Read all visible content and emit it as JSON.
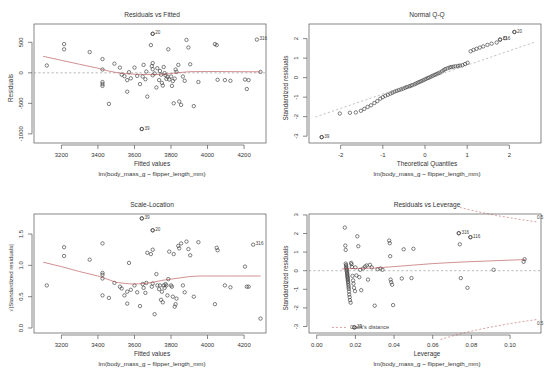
{
  "figure": {
    "kind": "r-lm-diagnostic-panel",
    "layout": "2x2",
    "width": 550,
    "height": 379,
    "model_caption": "lm(body_mass_g ~ flipper_length_mm)",
    "point_color": "#3c3c3c",
    "loess_color": "#b4474c",
    "reference_color": "#9a9a9a"
  },
  "chart_data": [
    {
      "type": "scatter",
      "id": "residuals-vs-fitted",
      "title": "Residuals vs Fitted",
      "xlabel": "Fitted values",
      "ylabel": "Residuals",
      "caption": "lm(body_mass_g ~ flipper_length_mm)",
      "xlim": [
        3050,
        4320
      ],
      "ylim": [
        -1150,
        800
      ],
      "xticks": [
        3200,
        3400,
        3600,
        3800,
        4000,
        4200
      ],
      "yticks": [
        -1000,
        -500,
        0,
        500
      ],
      "grid": false,
      "reference_line": {
        "type": "horizontal",
        "y": 0,
        "style": "dotted"
      },
      "smoother": "loess",
      "smoother_points": [
        [
          3100,
          270
        ],
        [
          3200,
          205
        ],
        [
          3300,
          140
        ],
        [
          3400,
          75
        ],
        [
          3450,
          35
        ],
        [
          3500,
          5
        ],
        [
          3550,
          -12
        ],
        [
          3600,
          -22
        ],
        [
          3650,
          -28
        ],
        [
          3700,
          -30
        ],
        [
          3750,
          -25
        ],
        [
          3800,
          -12
        ],
        [
          3850,
          5
        ],
        [
          3900,
          18
        ],
        [
          4000,
          22
        ],
        [
          4100,
          20
        ],
        [
          4200,
          18
        ],
        [
          4290,
          16
        ]
      ],
      "labeled_points": [
        {
          "label": "20",
          "x": 3700,
          "y": 640
        },
        {
          "label": "316",
          "x": 4270,
          "y": 545
        },
        {
          "label": "39",
          "x": 3640,
          "y": -920
        }
      ],
      "x": [
        3120,
        3215,
        3215,
        3355,
        3425,
        3425,
        3425,
        3425,
        3425,
        3460,
        3490,
        3520,
        3530,
        3545,
        3560,
        3560,
        3570,
        3580,
        3600,
        3615,
        3630,
        3640,
        3645,
        3650,
        3660,
        3665,
        3670,
        3690,
        3695,
        3700,
        3700,
        3700,
        3700,
        3710,
        3720,
        3725,
        3735,
        3740,
        3745,
        3750,
        3755,
        3760,
        3765,
        3770,
        3775,
        3780,
        3785,
        3790,
        3800,
        3805,
        3810,
        3815,
        3820,
        3825,
        3830,
        3840,
        3845,
        3855,
        3865,
        3875,
        3885,
        3895,
        3905,
        3925,
        3950,
        4040,
        4050,
        4055,
        4095,
        4125,
        4205,
        4215,
        4225,
        4290
      ],
      "y": [
        120,
        470,
        385,
        340,
        225,
        55,
        -150,
        -185,
        -215,
        -510,
        150,
        85,
        -30,
        -55,
        -120,
        -310,
        10,
        -90,
        85,
        -50,
        -185,
        -920,
        -60,
        130,
        -105,
        20,
        -390,
        455,
        110,
        640,
        160,
        60,
        -40,
        -10,
        -240,
        75,
        -120,
        30,
        -30,
        -165,
        -210,
        95,
        -5,
        -40,
        -100,
        -65,
        385,
        -110,
        -60,
        -215,
        -135,
        -500,
        -95,
        55,
        15,
        130,
        -470,
        -525,
        -60,
        -130,
        540,
        415,
        140,
        -545,
        -150,
        470,
        455,
        -115,
        -120,
        -130,
        -110,
        -265,
        -120,
        15
      ]
    },
    {
      "type": "scatter",
      "id": "normal-qq",
      "title": "Normal Q-Q",
      "xlabel": "Theoretical Quantiles",
      "ylabel": "Standardized residuals",
      "caption": "lm(body_mass_g ~ flipper_length_mm)",
      "xlim": [
        -2.75,
        2.75
      ],
      "ylim": [
        -3.35,
        2.75
      ],
      "xticks": [
        -2,
        -1,
        0,
        1,
        2
      ],
      "yticks": [
        -3,
        -2,
        -1,
        0,
        1,
        2
      ],
      "grid": false,
      "reference_line": {
        "type": "qq-line",
        "style": "dotted",
        "p1": [
          -2.6,
          -2.02
        ],
        "p2": [
          2.6,
          1.82
        ]
      },
      "labeled_points": [
        {
          "label": "39",
          "x": -2.45,
          "y": -3.05
        },
        {
          "label": "20",
          "x": 2.12,
          "y": 2.34
        },
        {
          "label": "316",
          "x": 1.78,
          "y": 1.95
        }
      ],
      "x": [
        -2.45,
        -2.02,
        -1.78,
        -1.64,
        -1.52,
        -1.44,
        -1.36,
        -1.28,
        -1.2,
        -1.13,
        -1.06,
        -1.0,
        -0.94,
        -0.88,
        -0.82,
        -0.77,
        -0.72,
        -0.67,
        -0.62,
        -0.57,
        -0.52,
        -0.47,
        -0.43,
        -0.38,
        -0.34,
        -0.3,
        -0.25,
        -0.21,
        -0.17,
        -0.13,
        -0.09,
        -0.05,
        -0.01,
        0.03,
        0.07,
        0.11,
        0.15,
        0.19,
        0.23,
        0.27,
        0.31,
        0.35,
        0.4,
        0.44,
        0.48,
        0.53,
        0.58,
        0.62,
        0.67,
        0.72,
        0.78,
        0.83,
        0.89,
        0.95,
        1.01,
        1.08,
        1.15,
        1.22,
        1.3,
        1.38,
        1.48,
        1.58,
        1.7,
        1.78,
        1.9,
        2.12
      ],
      "y": [
        -3.05,
        -1.84,
        -1.8,
        -1.78,
        -1.7,
        -1.6,
        -1.5,
        -1.42,
        -1.3,
        -1.2,
        -1.08,
        -1.0,
        -0.93,
        -0.88,
        -0.82,
        -0.77,
        -0.72,
        -0.68,
        -0.64,
        -0.6,
        -0.56,
        -0.52,
        -0.48,
        -0.45,
        -0.42,
        -0.38,
        -0.34,
        -0.3,
        -0.26,
        -0.22,
        -0.18,
        -0.14,
        -0.1,
        -0.06,
        -0.02,
        0.02,
        0.06,
        0.1,
        0.14,
        0.18,
        0.22,
        0.26,
        0.32,
        0.38,
        0.44,
        0.48,
        0.52,
        0.54,
        0.56,
        0.58,
        0.6,
        0.62,
        0.64,
        0.7,
        0.76,
        1.35,
        1.42,
        1.48,
        1.54,
        1.6,
        1.68,
        1.74,
        1.8,
        1.95,
        2.02,
        2.34
      ]
    },
    {
      "type": "scatter",
      "id": "scale-location",
      "title": "Scale-Location",
      "xlabel": "Fitted values",
      "ylabel": "√|Standardized residuals|",
      "caption": "lm(body_mass_g ~ flipper_length_mm)",
      "xlim": [
        3050,
        4320
      ],
      "ylim": [
        -0.08,
        1.82
      ],
      "xticks": [
        3200,
        3400,
        3600,
        3800,
        4000,
        4200
      ],
      "yticks": [
        0.0,
        0.5,
        1.0,
        1.5
      ],
      "grid": false,
      "smoother": "loess",
      "smoother_points": [
        [
          3100,
          1.05
        ],
        [
          3200,
          0.98
        ],
        [
          3300,
          0.9
        ],
        [
          3400,
          0.83
        ],
        [
          3450,
          0.78
        ],
        [
          3500,
          0.73
        ],
        [
          3550,
          0.71
        ],
        [
          3600,
          0.7
        ],
        [
          3650,
          0.71
        ],
        [
          3700,
          0.73
        ],
        [
          3750,
          0.76
        ],
        [
          3800,
          0.78
        ],
        [
          3850,
          0.8
        ],
        [
          3900,
          0.82
        ],
        [
          3950,
          0.83
        ],
        [
          4000,
          0.83
        ],
        [
          4100,
          0.83
        ],
        [
          4200,
          0.83
        ],
        [
          4290,
          0.83
        ]
      ],
      "labeled_points": [
        {
          "label": "39",
          "x": 3640,
          "y": 1.75
        },
        {
          "label": "20",
          "x": 3700,
          "y": 1.56
        },
        {
          "label": "316",
          "x": 4250,
          "y": 1.33
        }
      ],
      "x": [
        3120,
        3215,
        3215,
        3355,
        3425,
        3425,
        3425,
        3425,
        3425,
        3460,
        3490,
        3520,
        3530,
        3545,
        3560,
        3560,
        3570,
        3580,
        3600,
        3615,
        3630,
        3640,
        3645,
        3650,
        3660,
        3665,
        3670,
        3690,
        3695,
        3700,
        3700,
        3700,
        3710,
        3720,
        3725,
        3735,
        3740,
        3745,
        3750,
        3755,
        3760,
        3765,
        3770,
        3775,
        3780,
        3785,
        3790,
        3800,
        3805,
        3810,
        3815,
        3820,
        3825,
        3830,
        3840,
        3845,
        3855,
        3865,
        3875,
        3885,
        3895,
        3905,
        3925,
        3950,
        4040,
        4050,
        4055,
        4095,
        4125,
        4205,
        4215,
        4225,
        4290
      ],
      "y": [
        0.68,
        1.29,
        1.15,
        1.09,
        1.35,
        0.88,
        0.85,
        0.79,
        0.52,
        0.48,
        0.72,
        0.66,
        0.63,
        0.52,
        0.58,
        0.39,
        1.04,
        0.61,
        0.68,
        0.57,
        0.35,
        1.75,
        0.7,
        0.64,
        0.56,
        0.72,
        1.2,
        1.18,
        0.66,
        1.56,
        1.25,
        0.71,
        0.22,
        0.86,
        0.68,
        0.62,
        0.68,
        0.45,
        0.58,
        0.41,
        0.68,
        0.64,
        0.7,
        0.68,
        0.52,
        0.78,
        1.22,
        0.68,
        0.66,
        0.5,
        1.18,
        0.34,
        0.38,
        0.47,
        1.31,
        1.27,
        1.35,
        0.68,
        0.57,
        1.38,
        1.26,
        1.16,
        0.5,
        1.37,
        0.38,
        1.28,
        1.24,
        0.68,
        0.65,
        0.98,
        0.66,
        0.66,
        0.15
      ]
    },
    {
      "type": "scatter",
      "id": "residuals-vs-leverage",
      "title": "Residuals vs Leverage",
      "xlabel": "Leverage",
      "ylabel": "Standardized residuals",
      "caption": "lm(body_mass_g ~ flipper_length_mm)",
      "xlim": [
        -0.004,
        0.116
      ],
      "ylim": [
        -3.35,
        3.05
      ],
      "xticks": [
        0.0,
        0.02,
        0.04,
        0.06,
        0.08,
        0.1
      ],
      "yticks": [
        -3,
        -2,
        -1,
        0,
        1,
        2,
        3
      ],
      "grid": false,
      "legend": {
        "label": "Cook's distance",
        "x": 0.012,
        "y": -3.05
      },
      "cook_labels": [
        "0.5",
        "0.5"
      ],
      "reference_line": {
        "type": "horizontal",
        "y": 0,
        "style": "dotted"
      },
      "smoother": "loess",
      "smoother_points": [
        [
          0.013,
          0.1
        ],
        [
          0.02,
          0.12
        ],
        [
          0.03,
          0.14
        ],
        [
          0.04,
          0.22
        ],
        [
          0.05,
          0.3
        ],
        [
          0.06,
          0.38
        ],
        [
          0.07,
          0.44
        ],
        [
          0.08,
          0.49
        ],
        [
          0.09,
          0.53
        ],
        [
          0.1,
          0.57
        ],
        [
          0.108,
          0.6
        ]
      ],
      "labeled_points": [
        {
          "label": "39",
          "x": 0.0195,
          "y": -3.05
        },
        {
          "label": "316",
          "x": 0.0735,
          "y": 2.02
        },
        {
          "label": "116",
          "x": 0.0795,
          "y": 1.8
        }
      ],
      "x": [
        0.0145,
        0.0148,
        0.015,
        0.015,
        0.0152,
        0.0152,
        0.0153,
        0.0155,
        0.0155,
        0.0156,
        0.0157,
        0.0158,
        0.0158,
        0.0159,
        0.016,
        0.016,
        0.0161,
        0.0162,
        0.0163,
        0.0164,
        0.0165,
        0.0166,
        0.0167,
        0.0168,
        0.017,
        0.0172,
        0.0175,
        0.0178,
        0.018,
        0.0182,
        0.0185,
        0.0188,
        0.019,
        0.0193,
        0.0195,
        0.0198,
        0.02,
        0.0205,
        0.021,
        0.0215,
        0.022,
        0.0225,
        0.023,
        0.024,
        0.025,
        0.0258,
        0.0265,
        0.0275,
        0.0285,
        0.03,
        0.0315,
        0.033,
        0.034,
        0.0375,
        0.0378,
        0.038,
        0.0382,
        0.0385,
        0.039,
        0.0395,
        0.044,
        0.045,
        0.049,
        0.05,
        0.0735,
        0.074,
        0.0745,
        0.078,
        0.0795,
        0.0915,
        0.107,
        0.1075
      ],
      "y": [
        2.32,
        1.35,
        1.12,
        0.38,
        0.3,
        0.22,
        0.15,
        0.08,
        0.02,
        -0.05,
        -0.12,
        -0.18,
        -0.25,
        -0.32,
        -0.38,
        -0.45,
        -0.52,
        -0.6,
        -0.68,
        -0.78,
        -0.88,
        -0.98,
        -1.12,
        -1.28,
        -1.42,
        -1.58,
        -1.72,
        0.42,
        0.35,
        0.2,
        -0.28,
        -0.52,
        -0.7,
        -0.92,
        -3.05,
        -1.1,
        0.18,
        -0.25,
        1.85,
        1.32,
        -0.35,
        0.05,
        -1.05,
        0.12,
        0.22,
        0.28,
        -0.48,
        0.32,
        0.18,
        -1.88,
        0.08,
        0.12,
        0.05,
        1.62,
        1.48,
        0.78,
        -0.48,
        -0.62,
        -0.75,
        -1.85,
        -0.42,
        1.15,
        -0.4,
        1.18,
        2.02,
        1.42,
        -0.4,
        -0.92,
        1.8,
        0.05,
        0.48,
        0.62
      ]
    }
  ]
}
